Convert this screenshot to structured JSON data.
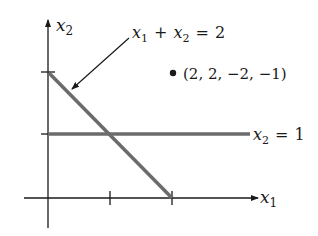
{
  "diagram": {
    "axes": {
      "x_label": "x",
      "x_sub": "1",
      "y_label": "x",
      "y_sub": "2"
    },
    "lines": [
      {
        "name": "x1 + x2 = 2",
        "label_parts": {
          "a": "x",
          "a_sub": "1",
          "op": "+",
          "b": "x",
          "b_sub": "2",
          "eq": "=",
          "rhs": "2"
        },
        "from": [
          0,
          2
        ],
        "to": [
          2,
          0
        ],
        "color": "#6b6b6b"
      },
      {
        "name": "x2 = 1",
        "label_parts": {
          "a": "x",
          "a_sub": "2",
          "eq": "=",
          "rhs": "1"
        },
        "from": [
          0,
          1
        ],
        "to": [
          3.2,
          1
        ],
        "color": "#6b6b6b"
      }
    ],
    "point": {
      "label": "(2, 2, −2, −1)"
    },
    "ticks": {
      "x": [
        1,
        2
      ],
      "y": [
        1,
        2
      ]
    },
    "colors": {
      "axis": "#1a1a1a",
      "constraint_line": "#6b6b6b",
      "background": "#ffffff"
    }
  }
}
